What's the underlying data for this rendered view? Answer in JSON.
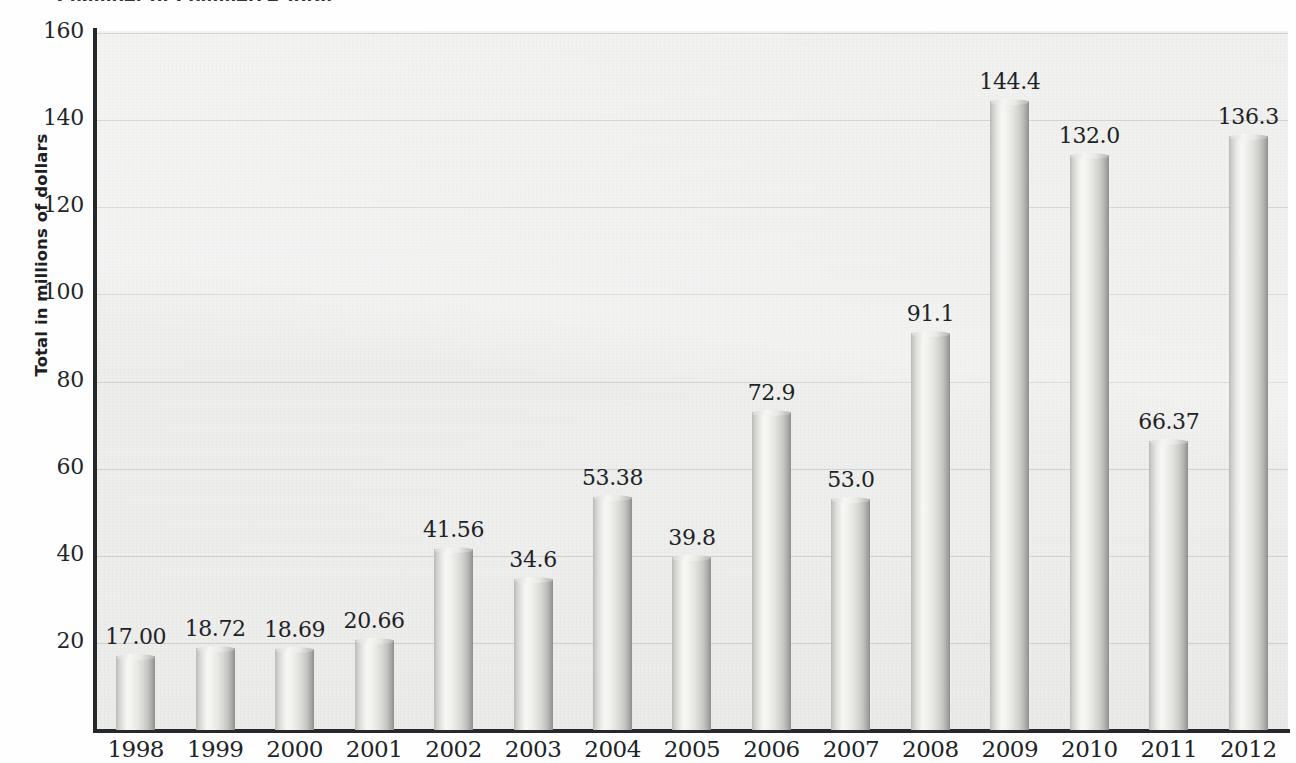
{
  "title": "Chamber of Commerce Total",
  "axis": {
    "y_label": "Total in millions of dollars",
    "y_ticks": [
      "20",
      "40",
      "60",
      "80",
      "100",
      "120",
      "140",
      "160"
    ]
  },
  "chart_data": {
    "type": "bar",
    "title": "Chamber of Commerce Total",
    "xlabel": "",
    "ylabel": "Total in millions of dollars",
    "ylim": [
      0,
      160
    ],
    "ytick_step": 20,
    "grid": true,
    "legend": "none",
    "categories": [
      "1998",
      "1999",
      "2000",
      "2001",
      "2002",
      "2003",
      "2004",
      "2005",
      "2006",
      "2007",
      "2008",
      "2009",
      "2010",
      "2011",
      "2012"
    ],
    "values": [
      17.0,
      18.72,
      18.69,
      20.66,
      41.56,
      34.6,
      53.38,
      39.8,
      72.9,
      53.0,
      91.1,
      144.4,
      132.0,
      66.37,
      136.3
    ],
    "value_labels": [
      "17.00",
      "18.72",
      "18.69",
      "20.66",
      "41.56",
      "34.6",
      "53.38",
      "39.8",
      "72.9",
      "53.0",
      "91.1",
      "144.4",
      "132.0",
      "66.37",
      "136.3"
    ]
  },
  "colors": {
    "plot_background": "#ededec",
    "gridline": "#c9c9c7",
    "axis_line": "#26292c",
    "bar_light": "#f7f7f5",
    "bar_dark": "#8e8e8a",
    "text": "#202326"
  }
}
